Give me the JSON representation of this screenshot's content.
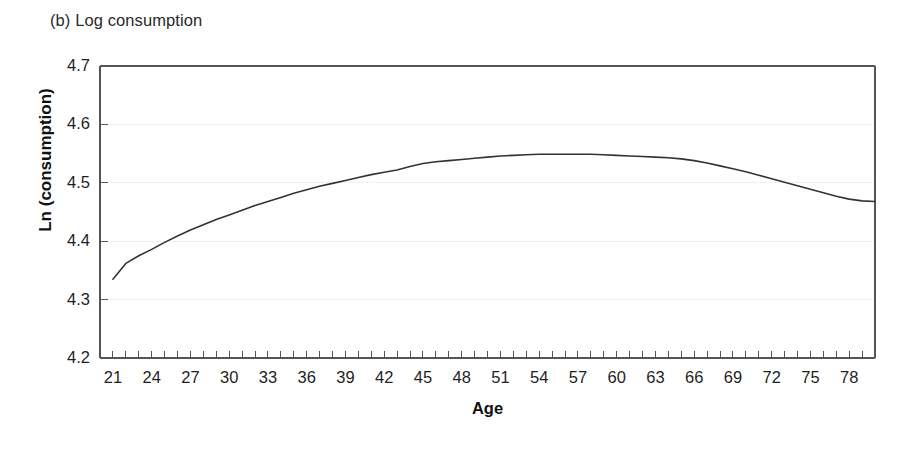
{
  "figure": {
    "panel_title": "(b) Log consumption",
    "background_color": "#ffffff",
    "line_color": "#333333",
    "axis_color": "#555555",
    "grid_color": "#f0f0f0"
  },
  "chart_data": {
    "type": "line",
    "title": "(b) Log consumption",
    "xlabel": "Age",
    "ylabel": "Ln (consumption)",
    "xlim": [
      20,
      80
    ],
    "ylim": [
      4.2,
      4.7
    ],
    "grid": true,
    "legend": null,
    "xtick_labels": [
      "21",
      "24",
      "27",
      "30",
      "33",
      "36",
      "39",
      "42",
      "45",
      "48",
      "51",
      "54",
      "57",
      "60",
      "63",
      "66",
      "69",
      "72",
      "75",
      "78"
    ],
    "xtick_values": [
      21,
      24,
      27,
      30,
      33,
      36,
      39,
      42,
      45,
      48,
      51,
      54,
      57,
      60,
      63,
      66,
      69,
      72,
      75,
      78
    ],
    "xtick_minor_step": 1,
    "ytick_labels": [
      "4.2",
      "4.3",
      "4.4",
      "4.5",
      "4.6",
      "4.7"
    ],
    "ytick_values": [
      4.2,
      4.3,
      4.4,
      4.5,
      4.6,
      4.7
    ],
    "series": [
      {
        "name": "Ln (consumption)",
        "x": [
          21,
          22,
          23,
          24,
          25,
          26,
          27,
          28,
          29,
          30,
          31,
          32,
          33,
          34,
          35,
          36,
          37,
          38,
          39,
          40,
          41,
          42,
          43,
          44,
          45,
          46,
          47,
          48,
          49,
          50,
          51,
          52,
          53,
          54,
          55,
          56,
          57,
          58,
          59,
          60,
          61,
          62,
          63,
          64,
          65,
          66,
          67,
          68,
          69,
          70,
          71,
          72,
          73,
          74,
          75,
          76,
          77,
          78,
          79,
          80
        ],
        "y": [
          4.335,
          4.362,
          4.375,
          4.386,
          4.398,
          4.409,
          4.419,
          4.428,
          4.437,
          4.445,
          4.453,
          4.461,
          4.468,
          4.475,
          4.482,
          4.488,
          4.494,
          4.499,
          4.504,
          4.509,
          4.514,
          4.518,
          4.522,
          4.528,
          4.533,
          4.536,
          4.538,
          4.54,
          4.542,
          4.544,
          4.546,
          4.547,
          4.548,
          4.549,
          4.549,
          4.549,
          4.549,
          4.549,
          4.548,
          4.547,
          4.546,
          4.545,
          4.544,
          4.543,
          4.541,
          4.538,
          4.534,
          4.529,
          4.524,
          4.519,
          4.513,
          4.507,
          4.501,
          4.495,
          4.489,
          4.483,
          4.477,
          4.472,
          4.469,
          4.468
        ]
      }
    ]
  }
}
